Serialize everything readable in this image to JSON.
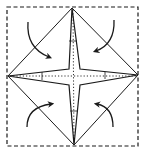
{
  "diagram": {
    "type": "origami-fold-instruction",
    "colors": {
      "background": "#ffffff",
      "stroke": "#1a1a1a"
    },
    "paper_outline": {
      "style": "dashed",
      "x": 7,
      "y": 7,
      "width": 131,
      "height": 139
    },
    "diamond_vertices": [
      {
        "name": "top",
        "x": 72,
        "y": 8
      },
      {
        "name": "right",
        "x": 138,
        "y": 75
      },
      {
        "name": "bottom",
        "x": 74,
        "y": 145
      },
      {
        "name": "left",
        "x": 8,
        "y": 76
      }
    ],
    "star_inner_corners": [
      {
        "name": "upper-left",
        "x": 69,
        "y": 69
      },
      {
        "name": "upper-right",
        "x": 80,
        "y": 69
      },
      {
        "name": "lower-right",
        "x": 80,
        "y": 85
      },
      {
        "name": "lower-left",
        "x": 69,
        "y": 85
      }
    ],
    "center_creases": {
      "style": "dotted",
      "horizontal_y": 76,
      "vertical_x": 74
    },
    "arrows": [
      {
        "name": "top-left",
        "direction": "toward-center"
      },
      {
        "name": "top-right",
        "direction": "toward-center"
      },
      {
        "name": "bottom-left",
        "direction": "toward-center"
      },
      {
        "name": "bottom-right",
        "direction": "toward-center"
      }
    ]
  }
}
